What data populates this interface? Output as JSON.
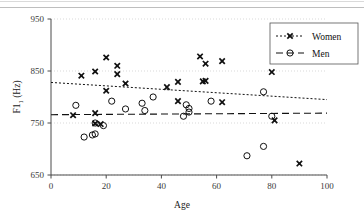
{
  "figure": {
    "name": "f1-by-age-scatter",
    "background": "#ffffff",
    "ink_color": "#111111",
    "grid_color": "#cfcfcf"
  },
  "chart_data": {
    "type": "scatter",
    "title": "",
    "xlabel": "Age",
    "ylabel": "F1 (Hz)",
    "xlim": [
      0,
      100
    ],
    "ylim": [
      650,
      950
    ],
    "xticks": [
      0,
      20,
      40,
      60,
      80,
      100
    ],
    "yticks": [
      650,
      750,
      850,
      950
    ],
    "xtick_labels": [
      "0",
      "20",
      "40",
      "60",
      "80",
      "100"
    ],
    "ytick_labels": [
      "650",
      "750",
      "850",
      "950"
    ],
    "grid": "horizontal-dotted",
    "legend_position": "top-right",
    "series": [
      {
        "name": "Women",
        "marker": "filled-x",
        "trendline_style": "dotted",
        "points": [
          [
            8,
            765
          ],
          [
            11,
            841
          ],
          [
            16,
            849
          ],
          [
            16,
            769
          ],
          [
            16,
            749
          ],
          [
            18,
            748
          ],
          [
            20,
            876
          ],
          [
            20,
            812
          ],
          [
            24,
            860
          ],
          [
            24,
            844
          ],
          [
            27,
            826
          ],
          [
            42,
            819
          ],
          [
            46,
            829
          ],
          [
            46,
            792
          ],
          [
            54,
            878
          ],
          [
            55,
            830
          ],
          [
            56,
            831
          ],
          [
            56,
            864
          ],
          [
            62,
            869
          ],
          [
            62,
            790
          ],
          [
            80,
            848
          ],
          [
            81,
            755
          ],
          [
            90,
            672
          ]
        ],
        "trendline": {
          "x": [
            0,
            100
          ],
          "y": [
            828,
            795
          ]
        }
      },
      {
        "name": "Men",
        "marker": "open-circle",
        "trendline_style": "dashed",
        "points": [
          [
            9,
            784
          ],
          [
            12,
            723
          ],
          [
            15,
            727
          ],
          [
            16,
            729
          ],
          [
            16,
            750
          ],
          [
            19,
            745
          ],
          [
            22,
            792
          ],
          [
            27,
            777
          ],
          [
            33,
            788
          ],
          [
            34,
            774
          ],
          [
            37,
            800
          ],
          [
            48,
            763
          ],
          [
            49,
            785
          ],
          [
            50,
            778
          ],
          [
            50,
            771
          ],
          [
            58,
            792
          ],
          [
            71,
            687
          ],
          [
            77,
            705
          ],
          [
            77,
            810
          ],
          [
            80,
            763
          ]
        ],
        "trendline": {
          "x": [
            0,
            100
          ],
          "y": [
            766,
            769
          ]
        }
      }
    ]
  },
  "legend": {
    "entries": [
      {
        "label": "Women",
        "marker": "filled-x",
        "line": "dotted"
      },
      {
        "label": "Men",
        "marker": "open-circle",
        "line": "dashed"
      }
    ]
  },
  "axes": {
    "x_title": "Age",
    "y_title_main": "F1",
    "y_title_sub": "1",
    "y_title_unit": " (Hz)"
  }
}
